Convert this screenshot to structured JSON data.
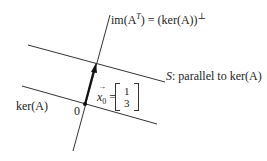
{
  "diagram": {
    "labels": {
      "image_line": "im(A",
      "image_sup": "T",
      "image_rest": ") = (ker(A))",
      "perp": "⊥",
      "s_name": "S",
      "s_desc": ": parallel to ker(A)",
      "kernel": "ker(A)",
      "origin": "0",
      "vector_name": "x",
      "vector_sub": "0",
      "equals": "=",
      "vector_entries": [
        "1",
        "3"
      ]
    },
    "colors": {
      "line": "#333333",
      "background": "#ffffff"
    }
  }
}
